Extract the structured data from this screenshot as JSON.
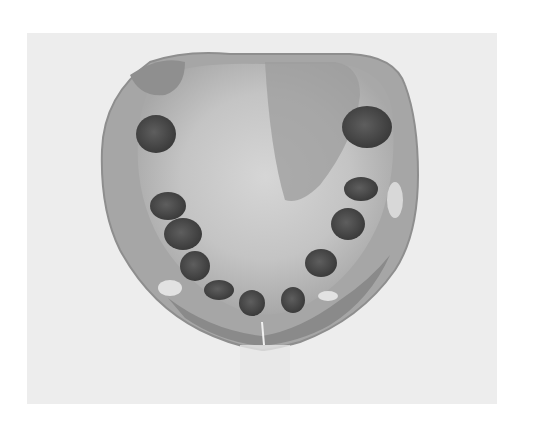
{
  "image": {
    "subject": "dental-cast",
    "description": "Grayscale photograph of a maxillary dental cast with empty tooth sockets",
    "colors": {
      "page_background": "#ffffff",
      "photo_background": "#ededed",
      "cast_body": "#a9a9a9",
      "cast_light": "#cfcfcf",
      "cast_dark": "#8c8c8c",
      "socket": "#4a4a4a"
    }
  }
}
